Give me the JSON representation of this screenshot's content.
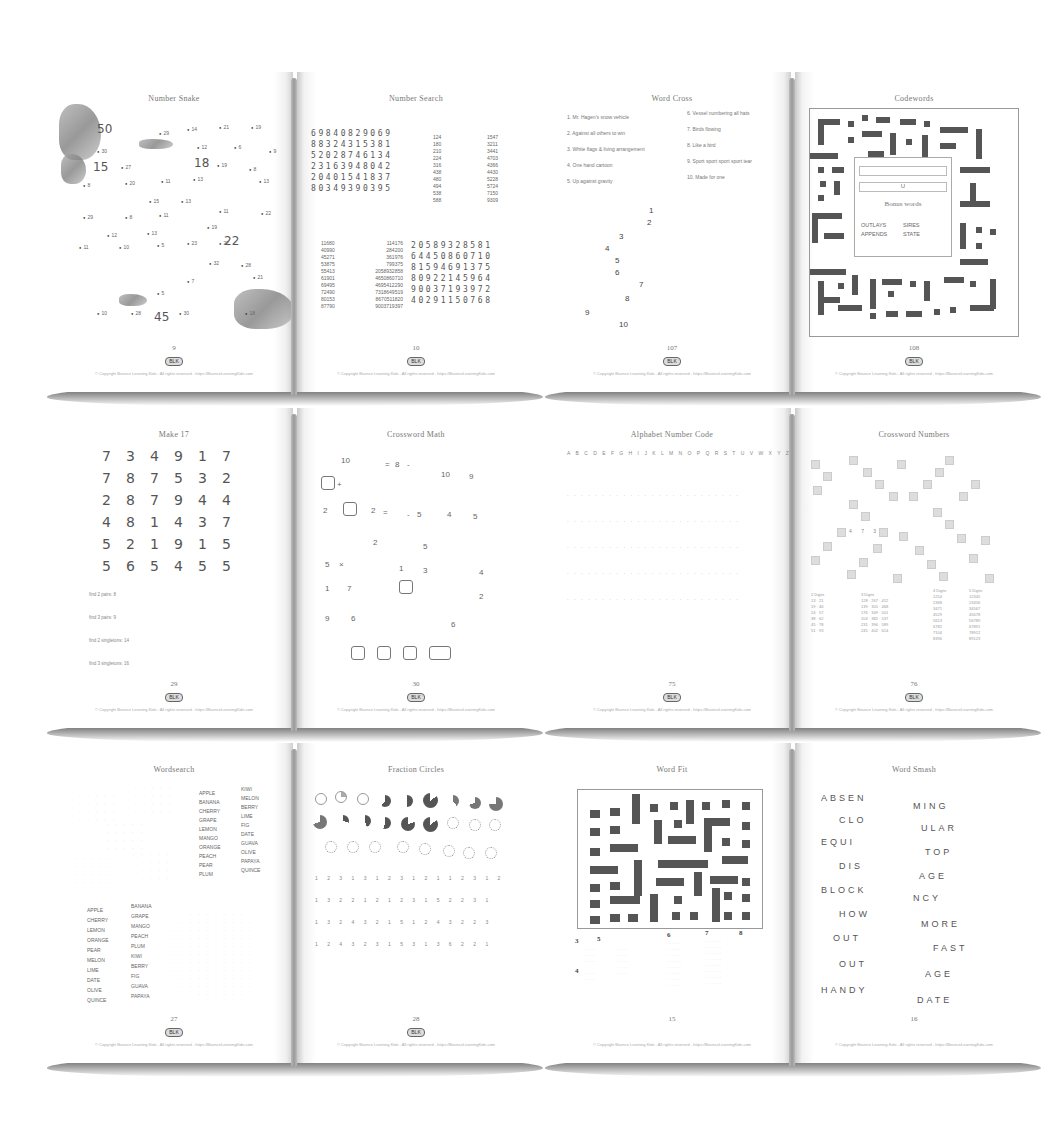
{
  "books": [
    {
      "left": {
        "title": "Number Snake",
        "page": "9",
        "big_numbers": [
          "50",
          "15",
          "18",
          "22",
          "45"
        ],
        "dot_labels": [
          "29",
          "14",
          "21",
          "19",
          "12",
          "6",
          "9",
          "30",
          "27",
          "19",
          "8",
          "8",
          "20",
          "11",
          "13",
          "15",
          "13",
          "13",
          "11",
          "29",
          "8",
          "11",
          "12",
          "13",
          "19",
          "22",
          "11",
          "10",
          "5",
          "23",
          "27",
          "32",
          "28",
          "21",
          "10",
          "28",
          "30",
          "7",
          "5",
          "18"
        ]
      },
      "right": {
        "title": "Number Search",
        "page": "10",
        "grid1": [
          "69840829069",
          "88324315381",
          "52028746134",
          "23163948042",
          "20401541837",
          "80349390395"
        ],
        "list1": [
          "124",
          "180",
          "210",
          "224",
          "316",
          "438",
          "480",
          "494",
          "538",
          "588"
        ],
        "list2": [
          "1547",
          "3211",
          "3441",
          "4703",
          "4366",
          "4430",
          "5228",
          "5724",
          "7150",
          "9309"
        ],
        "list3": [
          "11680",
          "40990",
          "45271",
          "53875",
          "55413",
          "61901",
          "69495",
          "72490",
          "80153",
          "87790"
        ],
        "list4": [
          "114176",
          "284200",
          "361976",
          "799375",
          "2058932858",
          "4650860710",
          "4695412290",
          "7318649519",
          "8670511820",
          "9003719397"
        ],
        "grid2": [
          "20589328581",
          "64450860710",
          "81594691375",
          "80922145964",
          "90037193972",
          "40291150768"
        ]
      }
    },
    {
      "left": {
        "title": "Word Cross",
        "page": "107",
        "clues_left": [
          "1. Mr. Hagen's snow vehicle",
          "2. Against all others to win",
          "3. White flags & living arrangement",
          "4. One hand cartoon",
          "5. Up against gravity"
        ],
        "clues_right": [
          "6. Vessel numbering all hats",
          "7. Birds flowing",
          "8. Like a bird",
          "9. Sport sport sport sport tear",
          "10. Made for one"
        ],
        "numbers": [
          "1",
          "2",
          "3",
          "4",
          "5",
          "6",
          "7",
          "8",
          "9",
          "10"
        ]
      },
      "right": {
        "title": "Codewords",
        "page": "108",
        "bonus_title": "Bonus words",
        "bonus_words": [
          "OUTLAYS",
          "SIRES",
          "APPENDS",
          "STATE"
        ],
        "letter_hint": "U"
      }
    },
    {
      "left": {
        "title": "Make 17",
        "page": "29",
        "grid": [
          [
            "7",
            "3",
            "4",
            "9",
            "1",
            "7"
          ],
          [
            "7",
            "8",
            "7",
            "5",
            "3",
            "2"
          ],
          [
            "2",
            "8",
            "7",
            "9",
            "4",
            "4"
          ],
          [
            "4",
            "8",
            "1",
            "4",
            "3",
            "7"
          ],
          [
            "5",
            "2",
            "1",
            "9",
            "1",
            "5"
          ],
          [
            "5",
            "6",
            "5",
            "4",
            "5",
            "5"
          ]
        ],
        "tasks": [
          "find 2 pairs: 8",
          "find 3 pairs: 9",
          "find 2 singletons: 14",
          "find 3 singletons: 16"
        ]
      },
      "right": {
        "title": "Crossword Math",
        "page": "30",
        "numbers": [
          "10",
          "8",
          "10",
          "9",
          "2",
          "2",
          "5",
          "4",
          "5",
          "2",
          "5",
          "5",
          "1",
          "3",
          "4",
          "1",
          "7",
          "2",
          "9",
          "6",
          "6"
        ],
        "ops": [
          "=",
          "-",
          "+",
          "=",
          "-",
          "×"
        ]
      }
    },
    {
      "left": {
        "title": "Alphabet Number Code",
        "page": "75",
        "alphabet": "A B C D E F G H I J K L M N O P Q R S T U V W X Y Z"
      },
      "right": {
        "title": "Crossword Numbers",
        "page": "76",
        "hint_digits": [
          "4",
          "7",
          "3"
        ],
        "col_headers": [
          "2 Digits",
          "3 Digits",
          "4 Digits",
          "5 Digits"
        ]
      }
    },
    {
      "left": {
        "title": "Wordsearch",
        "page": "27",
        "words_a": [
          "APPLE",
          "BANANA",
          "CHERRY",
          "GRAPE",
          "LEMON",
          "MANGO",
          "ORANGE",
          "PEACH",
          "PEAR",
          "PLUM"
        ],
        "words_b": [
          "KIWI",
          "MELON",
          "BERRY",
          "LIME",
          "FIG",
          "DATE",
          "GUAVA",
          "OLIVE",
          "PAPAYA",
          "QUINCE"
        ]
      },
      "right": {
        "title": "Fraction Circles",
        "page": "28"
      }
    },
    {
      "left": {
        "title": "Word Fit",
        "page": "15",
        "numbers": [
          "3",
          "5",
          "6",
          "7",
          "8",
          "4"
        ]
      },
      "right": {
        "title": "Word Smash",
        "page": "16",
        "left_words": [
          "ABSEN",
          "CLO",
          "EQUI",
          "DIS",
          "BLOCK",
          "HOW",
          "OUT",
          "OUT",
          "HANDY"
        ],
        "right_words": [
          "MING",
          "ULAR",
          "TOP",
          "AGE",
          "NCY",
          "MORE",
          "FAST",
          "AGE",
          "DATE"
        ]
      }
    }
  ],
  "footer": {
    "logo_text": "BLK",
    "copyright": "© Copyright Bounce Learning Kids - All rights reserved - https://BounceLearningKids.com"
  }
}
